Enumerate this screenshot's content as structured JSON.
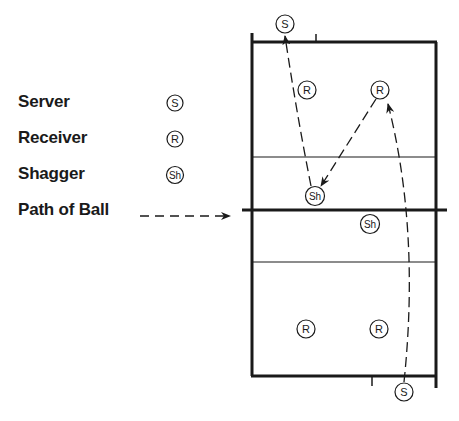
{
  "legend": {
    "items": [
      {
        "label": "Server",
        "symbol": "S"
      },
      {
        "label": "Receiver",
        "symbol": "R"
      },
      {
        "label": "Shagger",
        "symbol": "Sh"
      },
      {
        "label": "Path of Ball",
        "symbol": "dashed-arrow"
      }
    ]
  },
  "court": {
    "players": [
      {
        "role": "server",
        "label": "S",
        "x": 285,
        "y": 24
      },
      {
        "role": "receiver",
        "label": "R",
        "x": 307,
        "y": 90
      },
      {
        "role": "receiver",
        "label": "R",
        "x": 380,
        "y": 90
      },
      {
        "role": "shagger",
        "label": "Sh",
        "x": 315,
        "y": 196
      },
      {
        "role": "shagger",
        "label": "Sh",
        "x": 370,
        "y": 224
      },
      {
        "role": "receiver",
        "label": "R",
        "x": 306,
        "y": 329
      },
      {
        "role": "receiver",
        "label": "R",
        "x": 379,
        "y": 329
      },
      {
        "role": "server",
        "label": "S",
        "x": 404,
        "y": 392
      }
    ]
  },
  "colors": {
    "ink": "#1a1a1a",
    "background": "#ffffff"
  }
}
